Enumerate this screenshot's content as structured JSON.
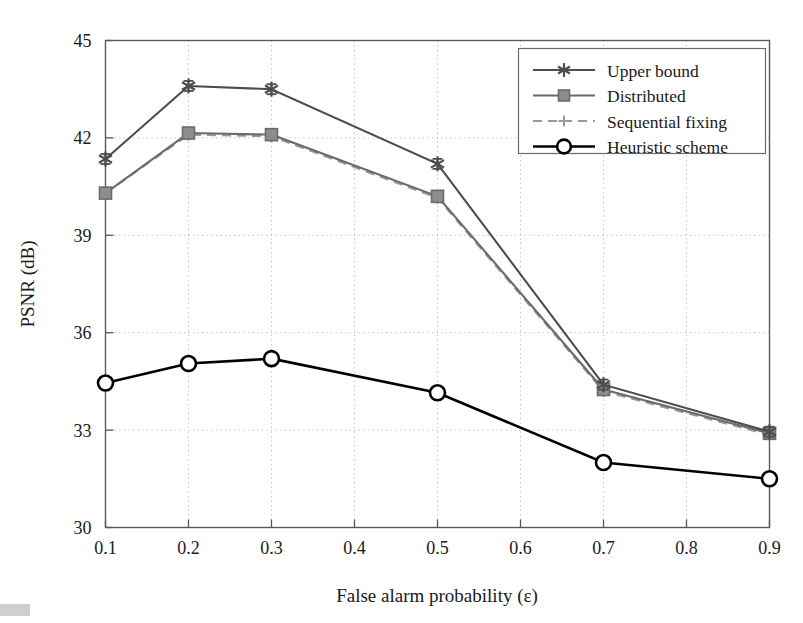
{
  "chart_data": {
    "type": "line",
    "title": "",
    "xlabel": "False alarm probability (ε)",
    "ylabel": "PSNR (dB)",
    "xlim": [
      0.1,
      0.9
    ],
    "ylim": [
      30,
      45
    ],
    "xticks": [
      "0.1",
      "0.2",
      "0.3",
      "0.4",
      "0.5",
      "0.6",
      "0.7",
      "0.8",
      "0.9"
    ],
    "xtick_values": [
      0.1,
      0.2,
      0.3,
      0.4,
      0.5,
      0.6,
      0.7,
      0.8,
      0.9
    ],
    "yticks": [
      "30",
      "33",
      "36",
      "39",
      "42",
      "45"
    ],
    "ytick_values": [
      30,
      33,
      36,
      39,
      42,
      45
    ],
    "grid": true,
    "grid_style": "dotted",
    "legend_position": "top-right",
    "x": [
      0.1,
      0.2,
      0.3,
      0.5,
      0.7,
      0.9
    ],
    "series": [
      {
        "name": "Upper bound",
        "marker": "star",
        "color": "#4d4d4d",
        "linestyle": "solid",
        "errorbars": true,
        "values": [
          41.35,
          43.6,
          43.5,
          41.2,
          34.4,
          32.95
        ]
      },
      {
        "name": "Distributed",
        "marker": "square",
        "color": "#6b6b6b",
        "linestyle": "solid",
        "errorbars": true,
        "values": [
          40.3,
          42.15,
          42.1,
          40.2,
          34.25,
          32.9
        ]
      },
      {
        "name": "Sequential fixing",
        "marker": "plus",
        "color": "#9a9a9a",
        "linestyle": "dashed",
        "errorbars": false,
        "values": [
          40.3,
          42.1,
          42.05,
          40.15,
          34.2,
          32.85
        ]
      },
      {
        "name": "Heuristic scheme",
        "marker": "circle",
        "color": "#000000",
        "linestyle": "solid",
        "errorbars": false,
        "values": [
          34.45,
          35.05,
          35.2,
          34.15,
          32.0,
          31.5
        ]
      }
    ]
  },
  "legend": {
    "items": [
      {
        "label": "Upper bound",
        "marker": "star-icon"
      },
      {
        "label": "Distributed",
        "marker": "square-icon"
      },
      {
        "label": "Sequential fixing",
        "marker": "plus-icon"
      },
      {
        "label": "Heuristic scheme",
        "marker": "circle-icon"
      }
    ]
  },
  "axes": {
    "x_title": "False alarm probability (ε)",
    "y_title": "PSNR (dB)",
    "x_tick_labels": [
      "0.1",
      "0.2",
      "0.3",
      "0.4",
      "0.5",
      "0.6",
      "0.7",
      "0.8",
      "0.9"
    ],
    "y_tick_labels": [
      "30",
      "33",
      "36",
      "39",
      "42",
      "45"
    ]
  },
  "colors": {
    "upper_bound": "#4d4d4d",
    "distributed": "#6b6b6b",
    "sequential_fixing": "#9a9a9a",
    "heuristic_scheme": "#000000",
    "grid": "#b9b9b9",
    "frame": "#5a5a5a",
    "background": "#ffffff"
  }
}
